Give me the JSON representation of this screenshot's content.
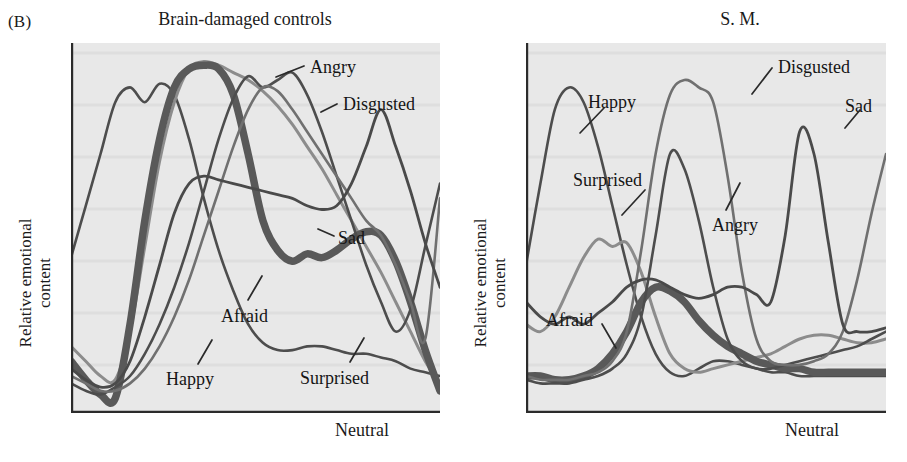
{
  "figure": {
    "panel_letter": "(B)",
    "background": "#ffffff",
    "plot_background": "#e8e8e8",
    "axis_color": "#2b2b2b"
  },
  "panels": [
    {
      "id": "brain-damaged-controls",
      "title": "Brain-damaged controls",
      "ylabel_line1": "Relative emotional",
      "ylabel_line2": "content",
      "xlabel": "Neutral",
      "labels": [
        {
          "name": "angry",
          "text": "Angry"
        },
        {
          "name": "disgusted",
          "text": "Disgusted"
        },
        {
          "name": "sad",
          "text": "Sad"
        },
        {
          "name": "afraid",
          "text": "Afraid"
        },
        {
          "name": "happy",
          "text": "Happy"
        },
        {
          "name": "surprised",
          "text": "Surprised"
        }
      ]
    },
    {
      "id": "s-m",
      "title": "S. M.",
      "ylabel_line1": "Relative emotional",
      "ylabel_line2": "content",
      "xlabel": "Neutral",
      "labels": [
        {
          "name": "disgusted",
          "text": "Disgusted"
        },
        {
          "name": "sad",
          "text": "Sad"
        },
        {
          "name": "happy",
          "text": "Happy"
        },
        {
          "name": "surprised",
          "text": "Surprised"
        },
        {
          "name": "angry",
          "text": "Angry"
        },
        {
          "name": "afraid",
          "text": "Afraid"
        }
      ]
    }
  ],
  "chart_data": {
    "type": "line",
    "xlabel": "Neutral",
    "ylabel": "Relative emotional content",
    "grid": false,
    "legend": "inline-labels",
    "xlim": [
      0,
      100
    ],
    "ylim": [
      0,
      100
    ],
    "panels": [
      {
        "name": "Brain-damaged controls",
        "series": [
          {
            "name": "Happy",
            "color": "#4d4d4d",
            "width": 2.6,
            "x": [
              0,
              4,
              8,
              12,
              16,
              20,
              24,
              28,
              32,
              36,
              40,
              44,
              48,
              52,
              56,
              60,
              64,
              68,
              72,
              76,
              80,
              84,
              88,
              92,
              96,
              100
            ],
            "y": [
              42,
              56,
              70,
              84,
              88,
              84,
              89,
              86,
              74,
              58,
              44,
              33,
              24,
              19,
              17,
              17,
              18,
              18,
              17,
              16,
              16,
              15,
              14,
              12,
              11,
              10
            ]
          },
          {
            "name": "Surprised",
            "color": "#8c8c8c",
            "width": 3.0,
            "x": [
              0,
              4,
              8,
              12,
              16,
              20,
              24,
              28,
              32,
              36,
              40,
              44,
              48,
              52,
              56,
              60,
              64,
              68,
              72,
              76,
              80,
              84,
              88,
              92,
              96,
              100
            ],
            "y": [
              18,
              14,
              10,
              9,
              22,
              45,
              68,
              84,
              93,
              95,
              94,
              92,
              90,
              87,
              83,
              78,
              72,
              66,
              59,
              52,
              45,
              38,
              30,
              22,
              14,
              8
            ]
          },
          {
            "name": "Afraid",
            "color": "#595959",
            "width": 7.5,
            "x": [
              0,
              4,
              8,
              12,
              16,
              20,
              24,
              28,
              32,
              36,
              40,
              44,
              48,
              52,
              56,
              60,
              64,
              68,
              72,
              76,
              80,
              84,
              88,
              92,
              96,
              100
            ],
            "y": [
              14,
              9,
              5,
              4,
              24,
              52,
              74,
              88,
              93,
              94,
              93,
              86,
              70,
              52,
              44,
              41,
              43,
              42,
              44,
              47,
              49,
              48,
              41,
              30,
              17,
              6
            ]
          },
          {
            "name": "Angry",
            "color": "#4d4d4d",
            "width": 2.6,
            "x": [
              0,
              4,
              8,
              12,
              16,
              20,
              24,
              28,
              32,
              36,
              40,
              44,
              48,
              52,
              56,
              60,
              64,
              68,
              72,
              76,
              80,
              84,
              88,
              92,
              96,
              100
            ],
            "y": [
              8,
              6,
              5,
              7,
              10,
              16,
              24,
              34,
              46,
              60,
              74,
              85,
              91,
              88,
              90,
              92,
              86,
              76,
              64,
              52,
              40,
              30,
              22,
              28,
              45,
              62
            ]
          },
          {
            "name": "Disgusted",
            "color": "#707070",
            "width": 2.6,
            "x": [
              0,
              4,
              8,
              12,
              16,
              20,
              24,
              28,
              32,
              36,
              40,
              44,
              48,
              52,
              56,
              60,
              64,
              68,
              72,
              76,
              80,
              84,
              88,
              92,
              96,
              100
            ],
            "y": [
              10,
              8,
              6,
              6,
              8,
              12,
              18,
              26,
              36,
              48,
              60,
              72,
              82,
              88,
              87,
              82,
              76,
              70,
              64,
              58,
              52,
              48,
              40,
              30,
              20,
              58
            ]
          },
          {
            "name": "Sad",
            "color": "#4a4a4a",
            "width": 2.8,
            "x": [
              0,
              4,
              8,
              12,
              16,
              20,
              24,
              28,
              32,
              36,
              40,
              44,
              48,
              52,
              56,
              60,
              64,
              68,
              72,
              76,
              80,
              84,
              88,
              92,
              96,
              100
            ],
            "y": [
              12,
              9,
              7,
              8,
              14,
              26,
              40,
              54,
              62,
              64,
              63,
              62,
              61,
              60,
              59,
              58,
              56,
              55,
              56,
              62,
              72,
              82,
              72,
              60,
              46,
              34
            ]
          }
        ]
      },
      {
        "name": "S. M.",
        "series": [
          {
            "name": "Happy",
            "color": "#4d4d4d",
            "width": 2.6,
            "x": [
              0,
              4,
              8,
              12,
              16,
              20,
              24,
              28,
              32,
              36,
              40,
              44,
              48,
              52,
              56,
              60,
              64,
              68,
              72,
              76,
              80,
              84,
              88,
              92,
              96,
              100
            ],
            "y": [
              40,
              62,
              82,
              88,
              84,
              72,
              56,
              40,
              26,
              16,
              11,
              10,
              12,
              14,
              14,
              13,
              12,
              11,
              11,
              10,
              10,
              10,
              10,
              10,
              10,
              10
            ]
          },
          {
            "name": "Surprised",
            "color": "#8c8c8c",
            "width": 3.0,
            "x": [
              0,
              4,
              8,
              12,
              16,
              20,
              24,
              28,
              32,
              36,
              40,
              44,
              48,
              52,
              56,
              60,
              64,
              68,
              72,
              76,
              80,
              84,
              88,
              92,
              96,
              100
            ],
            "y": [
              24,
              22,
              26,
              34,
              42,
              47,
              45,
              46,
              38,
              26,
              16,
              12,
              11,
              12,
              13,
              14,
              15,
              16,
              18,
              20,
              21,
              21,
              20,
              19,
              19,
              20
            ]
          },
          {
            "name": "Afraid",
            "color": "#595959",
            "width": 7.5,
            "x": [
              0,
              4,
              8,
              12,
              16,
              20,
              24,
              28,
              32,
              36,
              40,
              44,
              48,
              52,
              56,
              60,
              64,
              68,
              72,
              76,
              80,
              84,
              88,
              92,
              96,
              100
            ],
            "y": [
              10,
              10,
              9,
              9,
              10,
              12,
              16,
              22,
              30,
              34,
              33,
              30,
              25,
              21,
              18,
              16,
              14,
              13,
              12,
              12,
              11,
              11,
              11,
              11,
              11,
              11
            ]
          },
          {
            "name": "Angry",
            "color": "#4d4d4d",
            "width": 2.6,
            "x": [
              0,
              4,
              8,
              12,
              16,
              20,
              24,
              28,
              32,
              36,
              40,
              44,
              48,
              52,
              56,
              60,
              64,
              68,
              72,
              76,
              80,
              84,
              88,
              92,
              96,
              100
            ],
            "y": [
              9,
              8,
              8,
              8,
              9,
              10,
              12,
              16,
              26,
              48,
              70,
              66,
              52,
              34,
              20,
              14,
              12,
              12,
              13,
              14,
              15,
              16,
              17,
              18,
              20,
              22
            ]
          },
          {
            "name": "Disgusted",
            "color": "#707070",
            "width": 2.6,
            "x": [
              0,
              4,
              8,
              12,
              16,
              20,
              24,
              28,
              32,
              36,
              40,
              44,
              48,
              52,
              56,
              60,
              64,
              68,
              72,
              76,
              80,
              84,
              88,
              92,
              96,
              100
            ],
            "y": [
              10,
              9,
              9,
              9,
              10,
              11,
              14,
              22,
              44,
              70,
              86,
              90,
              88,
              84,
              64,
              38,
              20,
              14,
              13,
              13,
              14,
              16,
              22,
              36,
              54,
              70
            ]
          },
          {
            "name": "Sad",
            "color": "#4a4a4a",
            "width": 2.8,
            "x": [
              0,
              4,
              8,
              12,
              16,
              20,
              24,
              28,
              32,
              36,
              40,
              44,
              48,
              52,
              56,
              60,
              64,
              68,
              72,
              76,
              80,
              84,
              88,
              92,
              96,
              100
            ],
            "y": [
              30,
              26,
              24,
              26,
              24,
              27,
              30,
              34,
              36,
              36,
              34,
              32,
              31,
              32,
              34,
              34,
              32,
              30,
              48,
              76,
              70,
              46,
              24,
              22,
              22,
              23
            ]
          }
        ]
      }
    ]
  }
}
